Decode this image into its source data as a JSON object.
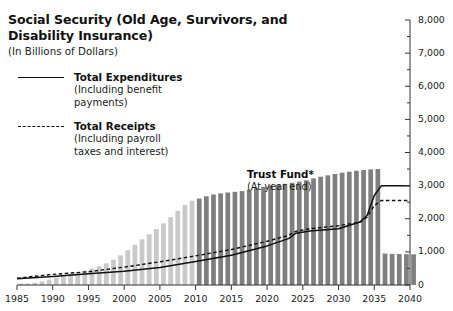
{
  "title": {
    "line1": "Social Security (Old Age, Survivors, and",
    "line2": "Disability Insurance)",
    "subtitle": "(In Billions of Dollars)"
  },
  "legend": {
    "position": "upper-left-inside",
    "items": [
      {
        "label": "Total Expenditures",
        "sub_line1": "(Including benefit",
        "sub_line2": "payments)",
        "style": "solid",
        "color": "#111111"
      },
      {
        "label": "Total Receipts",
        "sub_line1": "(Including payroll",
        "sub_line2": "taxes and interest)",
        "style": "dashed",
        "color": "#111111"
      }
    ]
  },
  "annotation": {
    "label": "Trust Fund*",
    "sub": "(At year end)"
  },
  "colors": {
    "bar_historical": "#c9c9c9",
    "bar_projected": "#7f7f7f",
    "line": "#111111",
    "axis": "#333333",
    "background": "#ffffff"
  },
  "chart_data": {
    "type": "bar",
    "title": "Social Security (Old Age, Survivors, and Disability Insurance)",
    "subtitle": "(In Billions of Dollars)",
    "xlabel": "",
    "ylabel": "",
    "ylim": [
      0,
      8000
    ],
    "xlim": [
      1985,
      2040
    ],
    "y_ticks": [
      0,
      1000,
      2000,
      3000,
      4000,
      5000,
      6000,
      7000,
      8000
    ],
    "y_tick_labels": [
      "0",
      "1,000",
      "2,000",
      "3,000",
      "4,000",
      "5,000",
      "6,000",
      "7,000",
      "8,000"
    ],
    "y_minor_step": 500,
    "x_ticks": [
      1985,
      1990,
      1995,
      2000,
      2005,
      2010,
      2015,
      2020,
      2025,
      2030,
      2035,
      2040
    ],
    "x_tick_labels": [
      "1985",
      "1990",
      "1995",
      "2000",
      "2005",
      "2010",
      "2015",
      "2020",
      "2025",
      "2030",
      "2035",
      "2040"
    ],
    "grid": false,
    "y_axis_position": "right",
    "bars": {
      "name": "Trust Fund (At year end)",
      "historical_through": 2009,
      "categories": [
        1985,
        1986,
        1987,
        1988,
        1989,
        1990,
        1991,
        1992,
        1993,
        1994,
        1995,
        1996,
        1997,
        1998,
        1999,
        2000,
        2001,
        2002,
        2003,
        2004,
        2005,
        2006,
        2007,
        2008,
        2009,
        2010,
        2011,
        2012,
        2013,
        2014,
        2015,
        2016,
        2017,
        2018,
        2019,
        2020,
        2021,
        2022,
        2023,
        2024,
        2025,
        2026,
        2027,
        2028,
        2029,
        2030,
        2031,
        2032,
        2033,
        2034,
        2035,
        2036,
        2037,
        2038,
        2039,
        2040
      ],
      "values": [
        42,
        46,
        69,
        109,
        163,
        225,
        281,
        331,
        378,
        436,
        496,
        567,
        656,
        762,
        896,
        1049,
        1213,
        1378,
        1531,
        1687,
        1859,
        2048,
        2239,
        2419,
        2541,
        2609,
        2678,
        2732,
        2765,
        2792,
        2813,
        2834,
        2879,
        2925,
        2960,
        3000,
        3030,
        3055,
        3085,
        3120,
        3160,
        3220,
        3270,
        3310,
        3350,
        3390,
        3420,
        3450,
        3470,
        3490,
        3500,
        950,
        940,
        935,
        930,
        925
      ]
    },
    "series": [
      {
        "name": "Total Expenditures",
        "sub": "(Including benefit payments)",
        "style": "solid",
        "x": [
          1985,
          1990,
          1995,
          2000,
          2005,
          2010,
          2015,
          2020,
          2023,
          2024,
          2026,
          2030,
          2033,
          2034,
          2035,
          2036,
          2040
        ],
        "values": [
          190,
          253,
          339,
          415,
          530,
          710,
          900,
          1180,
          1400,
          1560,
          1630,
          1700,
          1900,
          2100,
          2700,
          3000,
          3000
        ]
      },
      {
        "name": "Total Receipts",
        "sub": "(Including payroll taxes and interest)",
        "style": "dashed",
        "x": [
          1985,
          1990,
          1995,
          2000,
          2005,
          2010,
          2015,
          2020,
          2023,
          2024,
          2026,
          2030,
          2033,
          2034,
          2035,
          2036,
          2040
        ],
        "values": [
          205,
          320,
          400,
          540,
          700,
          880,
          1070,
          1320,
          1500,
          1620,
          1700,
          1790,
          1900,
          2050,
          2400,
          2550,
          2550
        ]
      }
    ]
  }
}
